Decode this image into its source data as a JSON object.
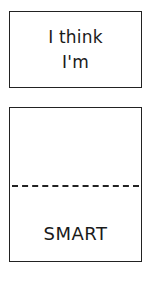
{
  "top_panel": {
    "lines": [
      "I think",
      "I'm"
    ]
  },
  "bottom_panel": {
    "answer": "SMART"
  },
  "colors": {
    "ink": "#222222",
    "background": "#ffffff"
  }
}
